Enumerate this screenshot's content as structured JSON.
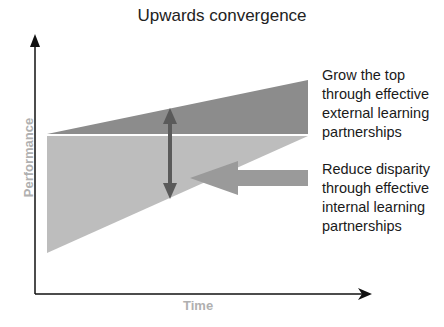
{
  "title": "Upwards convergence",
  "axes": {
    "y_label": "Performance",
    "x_label": "Time"
  },
  "annotations": {
    "top": {
      "lines": [
        "Grow the top",
        "through effective",
        "external learning",
        "partnerships"
      ]
    },
    "bottom": {
      "lines": [
        "Reduce disparity",
        "through effective",
        "internal learning",
        "partnerships"
      ]
    }
  },
  "colors": {
    "top_region": "#8c8c8c",
    "bottom_region": "#bdbdbd",
    "double_arrow": "#5a5a5a",
    "block_arrow": "#9a9a9a",
    "axis": "#111111",
    "axis_label": "#b0b0b0"
  },
  "icons": {
    "double_arrow": "vertical-double-arrow",
    "block_arrow": "left-block-arrow"
  }
}
